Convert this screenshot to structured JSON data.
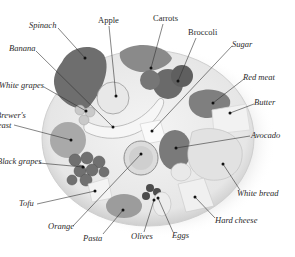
{
  "figure": {
    "colors": {
      "background": "#ffffff",
      "label_text": "#2a2a2a",
      "leader_line": "#333333",
      "plate": "#e9e9e9",
      "plate_rim": "#d2d2d2"
    },
    "labels": [
      {
        "id": "spinach",
        "text": "Spinach",
        "x": 29,
        "y": 21,
        "dot": [
          85,
          58
        ],
        "anchor": [
          58,
          28
        ],
        "upright": false
      },
      {
        "id": "apple",
        "text": "Apple",
        "x": 98,
        "y": 16,
        "dot": [
          116,
          96
        ],
        "anchor": [
          109,
          26
        ],
        "upright": true
      },
      {
        "id": "carrots",
        "text": "Carrots",
        "x": 153,
        "y": 14,
        "dot": [
          151,
          68
        ],
        "anchor": [
          163,
          24
        ],
        "upright": true
      },
      {
        "id": "broccoli",
        "text": "Broccoli",
        "x": 188,
        "y": 28,
        "dot": [
          178,
          81
        ],
        "anchor": [
          196,
          38
        ],
        "upright": true
      },
      {
        "id": "sugar",
        "text": "Sugar",
        "x": 232,
        "y": 40,
        "dot": [
          152,
          131
        ],
        "anchor": [
          232,
          46
        ],
        "upright": false
      },
      {
        "id": "red-meat",
        "text": "Red meat",
        "x": 243,
        "y": 73,
        "dot": [
          213,
          103
        ],
        "anchor": [
          244,
          79
        ],
        "upright": false
      },
      {
        "id": "butter",
        "text": "Butter",
        "x": 254,
        "y": 98,
        "dot": [
          230,
          113
        ],
        "anchor": [
          254,
          104
        ],
        "upright": false
      },
      {
        "id": "banana",
        "text": "Banana",
        "x": 9,
        "y": 44,
        "dot": [
          113,
          127
        ],
        "anchor": [
          36,
          51
        ],
        "upright": false
      },
      {
        "id": "white-grapes",
        "text": "White grapes",
        "x": -1,
        "y": 81,
        "dot": [
          86,
          111
        ],
        "anchor": [
          44,
          87
        ],
        "upright": false
      },
      {
        "id": "brewers-yeast-1",
        "text": "Brewer's",
        "x": -4,
        "y": 111,
        "dot": null,
        "anchor": null,
        "upright": false
      },
      {
        "id": "brewers-yeast-2",
        "text": "yeast",
        "x": -6,
        "y": 121,
        "dot": [
          71,
          140
        ],
        "anchor": [
          14,
          125
        ],
        "upright": false
      },
      {
        "id": "black-grapes",
        "text": "Black grapes",
        "x": -3,
        "y": 157,
        "dot": [
          83,
          167
        ],
        "anchor": [
          39,
          163
        ],
        "upright": false
      },
      {
        "id": "avocado",
        "text": "Avocado",
        "x": 251,
        "y": 131,
        "dot": [
          176,
          148
        ],
        "anchor": [
          250,
          136
        ],
        "upright": false
      },
      {
        "id": "white-bread",
        "text": "White bread",
        "x": 237,
        "y": 189,
        "dot": [
          223,
          164
        ],
        "anchor": [
          240,
          190
        ],
        "upright": false
      },
      {
        "id": "tofu",
        "text": "Tofu",
        "x": 19,
        "y": 199,
        "dot": [
          95,
          191
        ],
        "anchor": [
          37,
          204
        ],
        "upright": false
      },
      {
        "id": "orange",
        "text": "Orange",
        "x": 48,
        "y": 222,
        "dot": [
          141,
          154
        ],
        "anchor": [
          73,
          226
        ],
        "upright": false
      },
      {
        "id": "pasta",
        "text": "Pasta",
        "x": 83,
        "y": 234,
        "dot": [
          123,
          210
        ],
        "anchor": [
          103,
          234
        ],
        "upright": false
      },
      {
        "id": "olives",
        "text": "Olives",
        "x": 131,
        "y": 232,
        "dot": [
          154,
          200
        ],
        "anchor": [
          144,
          232
        ],
        "upright": false
      },
      {
        "id": "eggs",
        "text": "Eggs",
        "x": 172,
        "y": 231,
        "dot": [
          158,
          198
        ],
        "anchor": [
          173,
          232
        ],
        "upright": false
      },
      {
        "id": "hard-cheese",
        "text": "Hard cheese",
        "x": 215,
        "y": 216,
        "dot": [
          195,
          197
        ],
        "anchor": [
          215,
          218
        ],
        "upright": false
      }
    ]
  }
}
